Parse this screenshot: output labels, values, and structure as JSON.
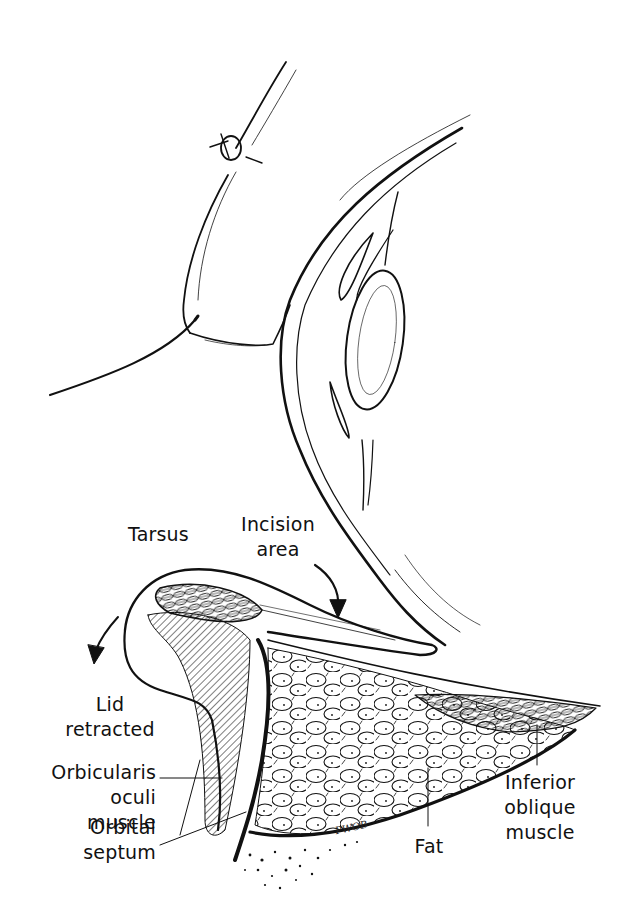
{
  "figure": {
    "type": "anatomical-illustration"
  },
  "labels": {
    "tarsus": "Tarsus",
    "incision_area_line1": "Incision",
    "incision_area_line2": "area",
    "lid_retracted_line1": "Lid",
    "lid_retracted_line2": "retracted",
    "orbicularis_line1": "Orbicularis",
    "orbicularis_line2": "oculi muscle",
    "orbital_septum_line1": "Orbital",
    "orbital_septum_line2": "septum",
    "fat": "Fat",
    "inferior_oblique_line1": "Inferior",
    "inferior_oblique_line2": "oblique",
    "inferior_oblique_line3": "muscle"
  },
  "signature": "PWOB",
  "colors": {
    "ink": "#111111",
    "background": "#ffffff"
  }
}
